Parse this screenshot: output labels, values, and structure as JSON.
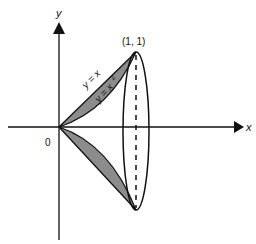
{
  "diagram": {
    "axes": {
      "x_label": "x",
      "y_label": "y",
      "origin_label": "0"
    },
    "point_label": "(1, 1)",
    "curves": [
      {
        "name": "line",
        "label": "y = x"
      },
      {
        "name": "parabola",
        "label_base": "y = x",
        "label_exp": "2"
      }
    ],
    "colors": {
      "shade": "#8c8c8c",
      "stroke": "#111111",
      "background": "#ffffff"
    }
  }
}
